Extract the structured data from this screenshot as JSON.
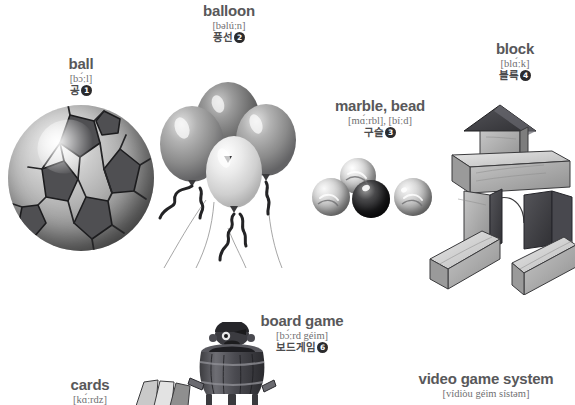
{
  "page": {
    "type": "picture-dictionary-page",
    "theme": "toys-and-games",
    "background_color": "#ffffff",
    "text_color": "#58585a",
    "badge_color": "#2b2b2d"
  },
  "entries": [
    {
      "id": "ball",
      "headword": "ball",
      "phonetic": "[bɔ́ːl]",
      "korean": "공",
      "number": "1",
      "illustration": "soccer-ball"
    },
    {
      "id": "balloon",
      "headword": "balloon",
      "phonetic": "[bəlúːn]",
      "korean": "풍선",
      "number": "2",
      "illustration": "balloon-bunch"
    },
    {
      "id": "marble-bead",
      "headword": "marble, bead",
      "phonetic": "[mɑ́ːrbl], [bíːd]",
      "korean": "구슬",
      "number": "3",
      "illustration": "marbles"
    },
    {
      "id": "block",
      "headword": "block",
      "phonetic": "[blɑ́ːk]",
      "korean": "블록",
      "number": "4",
      "illustration": "wooden-blocks"
    },
    {
      "id": "cards",
      "headword": "cards",
      "phonetic": "[kɑ́ːrdz]",
      "korean": "",
      "number": "",
      "illustration": "playing-cards"
    },
    {
      "id": "board-game",
      "headword": "board game",
      "phonetic": "[bɔ́ːrd géim]",
      "korean": "보드게임",
      "number": "6",
      "illustration": "pirate-barrel-game"
    },
    {
      "id": "video-game-system",
      "headword": "video game system",
      "phonetic": "[vídiòu géim sístəm]",
      "korean": "",
      "number": "",
      "illustration": "video-game-console"
    }
  ]
}
